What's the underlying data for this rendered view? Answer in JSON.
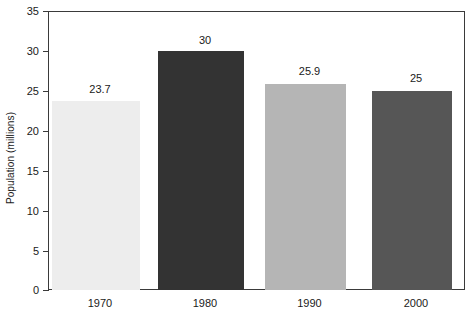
{
  "chart_data": {
    "type": "bar",
    "title": "",
    "xlabel": "",
    "ylabel": "Population (millions)",
    "categories": [
      "1970",
      "1980",
      "1990",
      "2000"
    ],
    "values": [
      23.7,
      30,
      25.9,
      25
    ],
    "value_labels": [
      "23.7",
      "30",
      "25.9",
      "25"
    ],
    "bar_colors": [
      "#ededed",
      "#333333",
      "#b5b5b5",
      "#565656"
    ],
    "ylim": [
      0,
      35
    ],
    "yticks": [
      0,
      5,
      10,
      15,
      20,
      25,
      30,
      35
    ],
    "ytick_labels": [
      "0",
      "5",
      "10",
      "15",
      "20",
      "25",
      "30",
      "35"
    ],
    "grid": false,
    "legend": "none",
    "frame_color": "#3a3a3a",
    "background": "#ffffff"
  }
}
